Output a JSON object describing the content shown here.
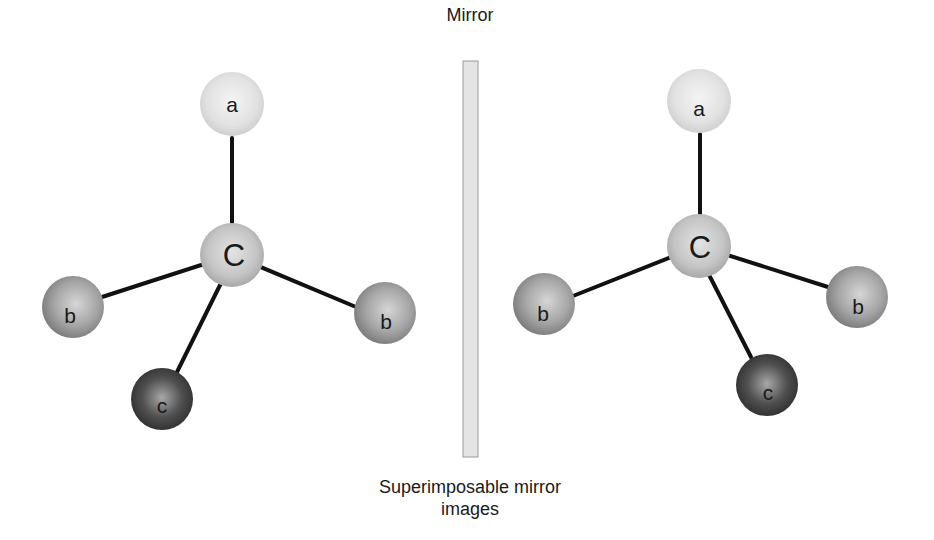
{
  "diagram": {
    "mirror_label": "Mirror",
    "caption_line1": "Superimposable mirror",
    "caption_line2": "images",
    "colors": {
      "atom_a": "#e6e6e6",
      "atom_center": "#c8c8c8",
      "atom_b": "#a8a8a8",
      "atom_c": "#4a4a4a",
      "bond": "#111111",
      "mirror_fill": "#e2e2e2",
      "mirror_border": "#999999"
    },
    "left_molecule": {
      "center": {
        "label": "C",
        "x": 232,
        "y": 255
      },
      "atoms": [
        {
          "label": "a",
          "x": 232,
          "y": 104
        },
        {
          "label": "b",
          "x": 73,
          "y": 307
        },
        {
          "label": "b",
          "x": 385,
          "y": 313
        },
        {
          "label": "c",
          "x": 162,
          "y": 399
        }
      ]
    },
    "right_molecule": {
      "center": {
        "label": "C",
        "x": 699,
        "y": 246
      },
      "atoms": [
        {
          "label": "a",
          "x": 699,
          "y": 101
        },
        {
          "label": "b",
          "x": 544,
          "y": 304
        },
        {
          "label": "b",
          "x": 857,
          "y": 297
        },
        {
          "label": "c",
          "x": 767,
          "y": 385
        }
      ]
    }
  }
}
